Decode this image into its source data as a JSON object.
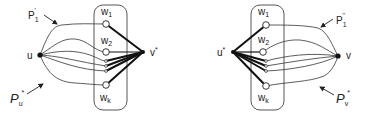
{
  "figure": {
    "left_panel": {
      "source_vertex": "u",
      "sink_vertex": "v*",
      "set_vertices": [
        "w1",
        "w2",
        "wk"
      ],
      "path_label_top": {
        "main": "P",
        "sub": "1",
        "sup": "'"
      },
      "path_label_bottom": {
        "main": "P",
        "sub": "u",
        "sup": "*"
      }
    },
    "right_panel": {
      "source_vertex": "u*",
      "sink_vertex": "v",
      "set_vertices": [
        "w1",
        "w2",
        "wk"
      ],
      "path_label_top": {
        "main": "P",
        "sub": "1",
        "sup": "''"
      },
      "path_label_bottom": {
        "main": "P",
        "sub": "v",
        "sup": "*"
      }
    },
    "colors": {
      "stroke": "#222222",
      "background": "#ffffff"
    }
  }
}
